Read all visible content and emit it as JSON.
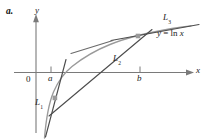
{
  "figure": {
    "part_label": "a.",
    "axes": {
      "x_axis_label": "x",
      "y_axis_label": "y",
      "origin_label": "0",
      "x_ticks": [
        {
          "name": "a",
          "label": "a",
          "x_px": 51
        },
        {
          "name": "b",
          "label": "b",
          "x_px": 140
        }
      ]
    },
    "curve": {
      "label": "y = ln x",
      "label_plain": "y = ln x",
      "equation_lhs": "y",
      "equation_eq": "=",
      "equation_rhs": "ln x",
      "color": "#9a9a9a"
    },
    "lines": [
      {
        "id": "L1",
        "base": "L",
        "subscript": "1",
        "description": "line through point below the x-axis on the curve",
        "color": "#4d4d4d"
      },
      {
        "id": "L2",
        "base": "L",
        "subscript": "2",
        "description": "secant line joining the two marked points on the curve",
        "color": "#4d4d4d"
      },
      {
        "id": "L3",
        "base": "L",
        "subscript": "3",
        "description": "tangent-type line at the upper right of the curve",
        "color": "#4d4d4d"
      }
    ],
    "points": [
      {
        "name": "lower-point",
        "x_px": 55,
        "y_px": 98,
        "color": "#9a9a9a"
      },
      {
        "name": "upper-point",
        "x_px": 138,
        "y_px": 36,
        "color": "#9a9a9a"
      }
    ],
    "colors": {
      "curve": "#9a9a9a",
      "line": "#4d4d4d",
      "axis": "#7a7a7a",
      "text": "#1a1a1a",
      "background": "#ffffff",
      "point": "#9a9a9a"
    }
  }
}
